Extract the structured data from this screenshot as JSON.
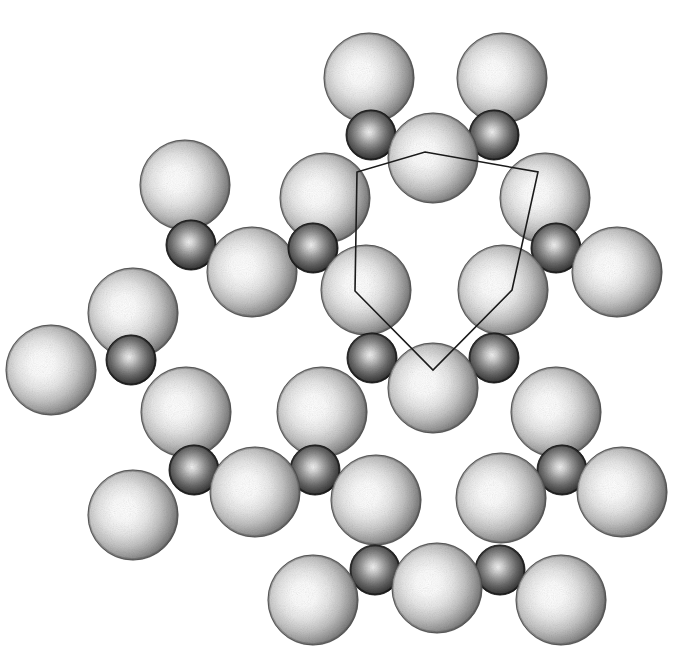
{
  "page": {
    "width": 678,
    "height": 659,
    "background_color": "#ffffff",
    "clipped_caption_fragment": "(        )  y                                  g"
  },
  "figure": {
    "style": "grayscale-shaded-spheres",
    "atom_types": [
      {
        "id": "large",
        "semantic_name": "oxygen-sphere",
        "radius": 45,
        "fill_light": "#ffffff",
        "fill_mid": "#d8d8d8",
        "fill_edge": "#6f6f6f",
        "outline": "#555555"
      },
      {
        "id": "small",
        "semantic_name": "silicon-sphere",
        "radius": 25,
        "fill_light": "#efefef",
        "fill_mid": "#8a8a8a",
        "fill_edge": "#2a2a2a",
        "outline": "#222222"
      }
    ],
    "ring_outline": {
      "semantic_name": "ring-polygon-outline",
      "stroke_color": "#1a1a1a",
      "stroke_width": 1.6,
      "closed": true,
      "vertices": [
        [
          425,
          152
        ],
        [
          538,
          172
        ],
        [
          512,
          290
        ],
        [
          433,
          370
        ],
        [
          355,
          291
        ],
        [
          357,
          172
        ]
      ]
    },
    "atoms": [
      {
        "id": "L01",
        "type": "large",
        "cx": 369,
        "cy": 78,
        "label": "O"
      },
      {
        "id": "L02",
        "type": "large",
        "cx": 502,
        "cy": 78,
        "label": "O"
      },
      {
        "id": "S01",
        "type": "small",
        "cx": 371,
        "cy": 135,
        "label": "Si"
      },
      {
        "id": "S02",
        "type": "small",
        "cx": 494,
        "cy": 135,
        "label": "Si"
      },
      {
        "id": "L03",
        "type": "large",
        "cx": 433,
        "cy": 158,
        "label": "O"
      },
      {
        "id": "L04",
        "type": "large",
        "cx": 325,
        "cy": 198,
        "label": "O"
      },
      {
        "id": "L05",
        "type": "large",
        "cx": 545,
        "cy": 198,
        "label": "O"
      },
      {
        "id": "L06",
        "type": "large",
        "cx": 185,
        "cy": 185,
        "label": "O"
      },
      {
        "id": "S03",
        "type": "small",
        "cx": 191,
        "cy": 245,
        "label": "Si"
      },
      {
        "id": "L07",
        "type": "large",
        "cx": 252,
        "cy": 272,
        "label": "O"
      },
      {
        "id": "S04",
        "type": "small",
        "cx": 313,
        "cy": 248,
        "label": "Si"
      },
      {
        "id": "S05",
        "type": "small",
        "cx": 556,
        "cy": 248,
        "label": "Si"
      },
      {
        "id": "L08",
        "type": "large",
        "cx": 617,
        "cy": 272,
        "label": "O"
      },
      {
        "id": "L09",
        "type": "large",
        "cx": 133,
        "cy": 313,
        "label": "O"
      },
      {
        "id": "L10",
        "type": "large",
        "cx": 366,
        "cy": 290,
        "label": "O"
      },
      {
        "id": "L11",
        "type": "large",
        "cx": 503,
        "cy": 290,
        "label": "O"
      },
      {
        "id": "L12",
        "type": "large",
        "cx": 51,
        "cy": 370,
        "label": "O"
      },
      {
        "id": "S06",
        "type": "small",
        "cx": 131,
        "cy": 360,
        "label": "Si"
      },
      {
        "id": "S07",
        "type": "small",
        "cx": 372,
        "cy": 358,
        "label": "Si"
      },
      {
        "id": "S08",
        "type": "small",
        "cx": 494,
        "cy": 358,
        "label": "Si"
      },
      {
        "id": "L13",
        "type": "large",
        "cx": 186,
        "cy": 412,
        "label": "O"
      },
      {
        "id": "L14",
        "type": "large",
        "cx": 322,
        "cy": 412,
        "label": "O"
      },
      {
        "id": "L15",
        "type": "large",
        "cx": 433,
        "cy": 388,
        "label": "O"
      },
      {
        "id": "L16",
        "type": "large",
        "cx": 556,
        "cy": 412,
        "label": "O"
      },
      {
        "id": "S09",
        "type": "small",
        "cx": 194,
        "cy": 470,
        "label": "Si"
      },
      {
        "id": "S10",
        "type": "small",
        "cx": 315,
        "cy": 470,
        "label": "Si"
      },
      {
        "id": "S11",
        "type": "small",
        "cx": 562,
        "cy": 470,
        "label": "Si"
      },
      {
        "id": "L17",
        "type": "large",
        "cx": 133,
        "cy": 515,
        "label": "O"
      },
      {
        "id": "L18",
        "type": "large",
        "cx": 255,
        "cy": 492,
        "label": "O"
      },
      {
        "id": "L19",
        "type": "large",
        "cx": 376,
        "cy": 500,
        "label": "O"
      },
      {
        "id": "L20",
        "type": "large",
        "cx": 501,
        "cy": 498,
        "label": "O"
      },
      {
        "id": "L21",
        "type": "large",
        "cx": 622,
        "cy": 492,
        "label": "O"
      },
      {
        "id": "S12",
        "type": "small",
        "cx": 375,
        "cy": 570,
        "label": "Si"
      },
      {
        "id": "S13",
        "type": "small",
        "cx": 500,
        "cy": 570,
        "label": "Si"
      },
      {
        "id": "L22",
        "type": "large",
        "cx": 313,
        "cy": 600,
        "label": "O"
      },
      {
        "id": "L23",
        "type": "large",
        "cx": 437,
        "cy": 588,
        "label": "O"
      },
      {
        "id": "L24",
        "type": "large",
        "cx": 561,
        "cy": 600,
        "label": "O"
      }
    ]
  }
}
